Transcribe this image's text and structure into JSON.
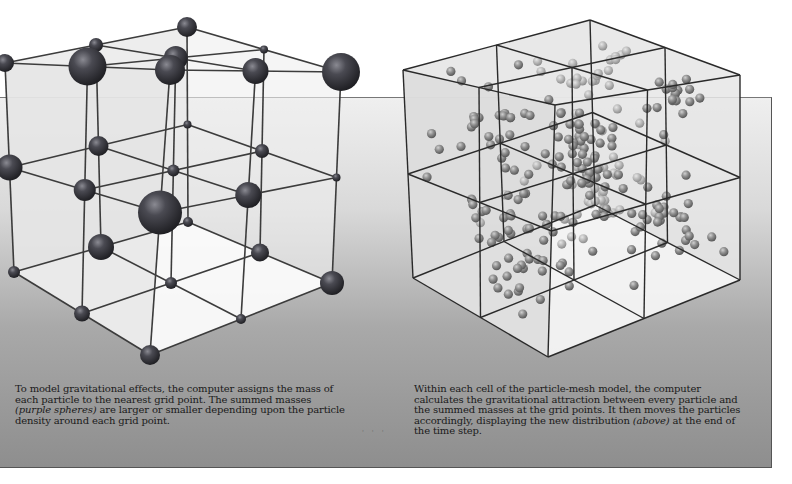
{
  "figure": {
    "left_panel": {
      "name": "grid-mass-assignment",
      "description": "3x3x3 wireframe grid with spheres of varying size at grid points",
      "grid_divisions": 2,
      "sphere_color": "#3a3a40",
      "line_color": "#3c3c3c",
      "caption": {
        "part1": "To model gravitational effects, the computer assigns the mass of each particle to the nearest grid point. The summed masses ",
        "emphasis": "(purple spheres)",
        "part2": " are larger or smaller depending upon the particle density around each grid point."
      }
    },
    "right_panel": {
      "name": "particle-mesh-cells",
      "description": "2x2x2 cell cube filled with small particle spheres",
      "grid_divisions": 2,
      "particle_color": "#8a8a8a",
      "line_color": "#2a2a2a",
      "caption": {
        "part1": "Within each cell of the particle-mesh model, the computer calculates the gravitational attraction between every particle and the summed masses at the grid points. It then moves the particles accordingly, displaying the new distribution ",
        "emphasis": "(above)",
        "part2": " at the end of the time step."
      }
    },
    "background": {
      "gradient_top": "#efefef",
      "gradient_bottom": "#8e8e8e"
    }
  }
}
